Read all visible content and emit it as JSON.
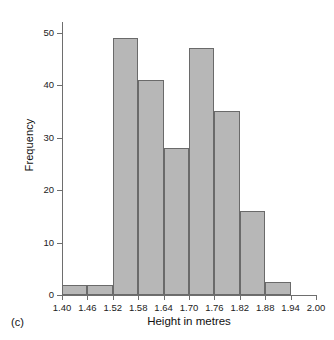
{
  "figure": {
    "caption": "(c)"
  },
  "chart_data": {
    "type": "bar",
    "title": "",
    "subtitle": "",
    "xlabel": "Height in metres",
    "ylabel": "Frequency",
    "bin_width": 0.06,
    "bin_edges": [
      1.4,
      1.46,
      1.52,
      1.58,
      1.64,
      1.7,
      1.76,
      1.82,
      1.88,
      1.94
    ],
    "categories": [
      "1.40-1.46",
      "1.46-1.52",
      "1.52-1.58",
      "1.58-1.64",
      "1.64-1.70",
      "1.70-1.76",
      "1.76-1.82",
      "1.82-1.88",
      "1.88-1.94"
    ],
    "values": [
      2,
      2,
      49,
      41,
      28,
      47,
      35,
      16,
      2.5
    ],
    "xlim": [
      1.4,
      2.0
    ],
    "ylim": [
      0,
      52
    ],
    "xticks": [
      1.4,
      1.46,
      1.52,
      1.58,
      1.64,
      1.7,
      1.76,
      1.82,
      1.88,
      1.94,
      2.0
    ],
    "xtick_labels": [
      "1.40",
      "1.46",
      "1.52",
      "1.58",
      "1.64",
      "1.70",
      "1.76",
      "1.82",
      "1.88",
      "1.94",
      "2.00"
    ],
    "yticks": [
      0,
      10,
      20,
      30,
      40,
      50
    ],
    "ytick_labels": [
      "0",
      "10",
      "20",
      "30",
      "40",
      "50"
    ],
    "grid": false,
    "legend": null,
    "bar_fill_color": "#b7b7b7",
    "bar_edge_color": "#6a6a6a",
    "axis_color": "#6e6e6e"
  }
}
